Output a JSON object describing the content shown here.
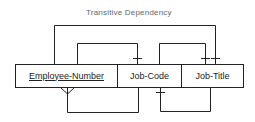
{
  "diagram": {
    "title": "Transitive Dependency",
    "fields": [
      {
        "label": "Employee-Number",
        "primary_key": true
      },
      {
        "label": "Job-Code",
        "primary_key": false
      },
      {
        "label": "Job-Title",
        "primary_key": false
      }
    ],
    "relationships": [
      {
        "from": "Employee-Number",
        "to": "Job-Title",
        "type": "one",
        "position": "above-outer"
      },
      {
        "from": "Employee-Number",
        "to": "Job-Code",
        "type": "one",
        "position": "above"
      },
      {
        "from": "Job-Code",
        "to": "Job-Title",
        "type": "one",
        "position": "above"
      },
      {
        "from": "Job-Code",
        "to": "Employee-Number",
        "type": "many",
        "position": "below"
      },
      {
        "from": "Job-Title",
        "to": "Job-Code",
        "type": "one",
        "position": "below"
      }
    ],
    "colors": {
      "line": "#222222",
      "title": "#666666"
    }
  }
}
